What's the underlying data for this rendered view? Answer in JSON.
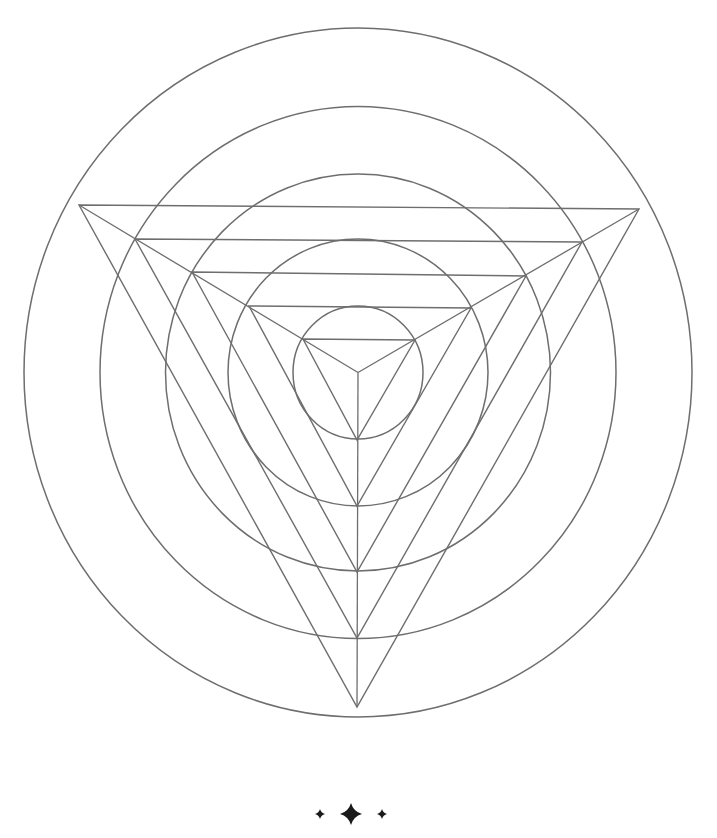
{
  "colors": {
    "stroke": "#6e6e6e",
    "ornament": "#1a1a1a",
    "background": "#ffffff"
  },
  "center": {
    "x": 358,
    "y": 372.5
  },
  "circles": [
    {
      "rx": 334,
      "ry": 344.5
    },
    {
      "rx": 258,
      "ry": 266
    },
    {
      "rx": 192.5,
      "ry": 198.5
    },
    {
      "rx": 130,
      "ry": 133.5
    },
    {
      "rx": 65,
      "ry": 66.5
    }
  ],
  "triangles": [
    {
      "left": [
        79,
        205
      ],
      "right": [
        639,
        209
      ],
      "bottom": [
        357,
        707
      ]
    },
    {
      "left": [
        135,
        239
      ],
      "right": [
        582,
        242
      ],
      "bottom": [
        357,
        638
      ]
    },
    {
      "left": [
        192,
        272
      ],
      "right": [
        526,
        276
      ],
      "bottom": [
        357,
        572
      ]
    },
    {
      "left": [
        249,
        306
      ],
      "right": [
        471,
        308
      ],
      "bottom": [
        357,
        506
      ]
    },
    {
      "left": [
        303,
        339
      ],
      "right": [
        415,
        340
      ],
      "bottom": [
        357,
        440
      ]
    }
  ],
  "spokes_to_center": [
    [
      79,
      205
    ],
    [
      639,
      209
    ],
    [
      357,
      707
    ]
  ],
  "ornament": {
    "line_left": [
      200,
      305
    ],
    "line_right": [
      398,
      515
    ],
    "y": 814,
    "stars": [
      {
        "x": 320,
        "size": 5
      },
      {
        "x": 351,
        "size": 11
      },
      {
        "x": 382,
        "size": 5
      }
    ]
  }
}
